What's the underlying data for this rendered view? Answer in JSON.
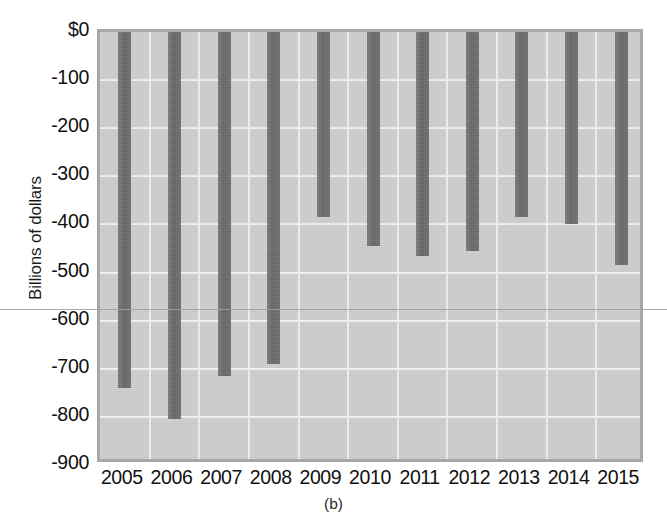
{
  "chart_data": {
    "type": "bar",
    "title": "",
    "subtitle": "",
    "caption": "(b)",
    "xlabel": "",
    "ylabel": "Billions of dollars",
    "categories": [
      "2005",
      "2006",
      "2007",
      "2008",
      "2009",
      "2010",
      "2011",
      "2012",
      "2013",
      "2014",
      "2015"
    ],
    "values": [
      -740,
      -805,
      -715,
      -690,
      -385,
      -445,
      -465,
      -455,
      -385,
      -400,
      -485
    ],
    "ylim": [
      -900,
      0
    ],
    "xlim_note": "categorical, 11 yearly categories",
    "ytick_labels": [
      "$0",
      "-100",
      "-200",
      "-300",
      "-400",
      "-500",
      "-600",
      "-700",
      "-800",
      "-900"
    ],
    "ytick_values": [
      0,
      -100,
      -200,
      -300,
      -400,
      -500,
      -600,
      -700,
      -800,
      -900
    ],
    "grid": "horizontal and vertical gridlines, white on gray panel",
    "legend": "none",
    "legend_position": "none",
    "series": [
      {
        "name": "Federal budget deficit",
        "values": [
          -740,
          -805,
          -715,
          -690,
          -385,
          -445,
          -465,
          -455,
          -385,
          -400,
          -485
        ]
      }
    ],
    "annotations": [],
    "colors": {
      "bar": "#6e6e6e",
      "panel": "#cfcfcf",
      "gridline": "#f2f2f2",
      "frame": "#a8a8a8",
      "text": "#111111",
      "background": "#ffffff"
    }
  }
}
